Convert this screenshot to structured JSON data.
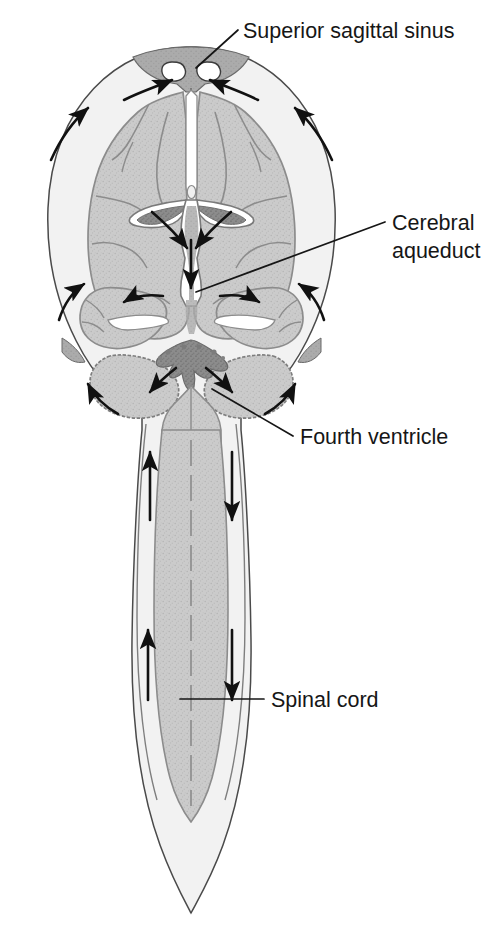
{
  "figure": {
    "background_color": "#ffffff",
    "width": 495,
    "height": 925
  },
  "palette": {
    "outline": "#3c3c3c",
    "brain_tissue": "#c9c9c9",
    "brain_tissue_edge": "#8f8f8f",
    "csf_space": "#f2f2f2",
    "dural_sinus": "#a8a8a8",
    "choroid_plexus": "#8a8a8a",
    "arachnoid_granulation": "#ffffff",
    "arrow": "#111111",
    "label": "#161616"
  },
  "labels": [
    {
      "id": "superior-sagittal-sinus",
      "text": "Superior sagittal sinus",
      "lines": [
        "Superior sagittal sinus"
      ],
      "text_x": 243,
      "text_y": 38,
      "anchor": "start",
      "leader": {
        "x1": 238,
        "y1": 30,
        "x2": 196,
        "y2": 68
      }
    },
    {
      "id": "cerebral-aqueduct",
      "text": "Cerebral aqueduct",
      "lines": [
        "Cerebral",
        "aqueduct"
      ],
      "text_x": 392,
      "text_y": 230,
      "line_height": 28,
      "anchor": "start",
      "leader": {
        "x1": 385,
        "y1": 222,
        "x2": 196,
        "y2": 292
      }
    },
    {
      "id": "fourth-ventricle",
      "text": "Fourth ventricle",
      "lines": [
        "Fourth ventricle"
      ],
      "text_x": 300,
      "text_y": 444,
      "anchor": "start",
      "leader": {
        "x1": 293,
        "y1": 436,
        "x2": 212,
        "y2": 389
      }
    },
    {
      "id": "spinal-cord",
      "text": "Spinal cord",
      "lines": [
        "Spinal cord"
      ],
      "text_x": 271,
      "text_y": 707,
      "anchor": "start",
      "leader": {
        "x1": 264,
        "y1": 699,
        "x2": 180,
        "y2": 699
      }
    }
  ],
  "structures": [
    {
      "id": "cranial-outline",
      "name": "Skull / dura outline",
      "visible": true
    },
    {
      "id": "subarachnoid-space",
      "name": "Subarachnoid space",
      "visible": true
    },
    {
      "id": "superior-sagittal-sinus-region",
      "name": "Superior sagittal sinus",
      "visible": true
    },
    {
      "id": "arachnoid-granulations",
      "name": "Arachnoid granulations",
      "count": 2,
      "visible": true
    },
    {
      "id": "cerebral-hemisphere-left",
      "name": "Left cerebral hemisphere",
      "visible": true
    },
    {
      "id": "cerebral-hemisphere-right",
      "name": "Right cerebral hemisphere",
      "visible": true
    },
    {
      "id": "lateral-ventricle-left",
      "name": "Left lateral ventricle",
      "visible": true
    },
    {
      "id": "lateral-ventricle-right",
      "name": "Right lateral ventricle",
      "visible": true
    },
    {
      "id": "choroid-plexus-lateral",
      "name": "Choroid plexus of lateral ventricles",
      "visible": true
    },
    {
      "id": "third-ventricle",
      "name": "Third ventricle",
      "visible": true
    },
    {
      "id": "cerebral-aqueduct-structure",
      "name": "Cerebral aqueduct",
      "visible": true
    },
    {
      "id": "temporal-lobe-left",
      "name": "Left temporal lobe",
      "visible": true
    },
    {
      "id": "temporal-lobe-right",
      "name": "Right temporal lobe",
      "visible": true
    },
    {
      "id": "cerebellum-left",
      "name": "Left cerebellar hemisphere",
      "visible": true
    },
    {
      "id": "cerebellum-right",
      "name": "Right cerebellar hemisphere",
      "visible": true
    },
    {
      "id": "fourth-ventricle-structure",
      "name": "Fourth ventricle choroid plexus",
      "visible": true
    },
    {
      "id": "transverse-sinus-left",
      "name": "Left transverse sinus",
      "visible": true
    },
    {
      "id": "transverse-sinus-right",
      "name": "Right transverse sinus",
      "visible": true
    },
    {
      "id": "brainstem",
      "name": "Brainstem / medulla",
      "visible": true
    },
    {
      "id": "spinal-cord-structure",
      "name": "Spinal cord",
      "visible": true
    },
    {
      "id": "central-canal",
      "name": "Central canal of spinal cord",
      "visible": true
    },
    {
      "id": "dural-sac",
      "name": "Dural sac / lumbar cistern",
      "visible": true
    }
  ],
  "flow_arrows": {
    "description": "Arrows indicating cerebrospinal fluid flow direction",
    "count": 16
  }
}
